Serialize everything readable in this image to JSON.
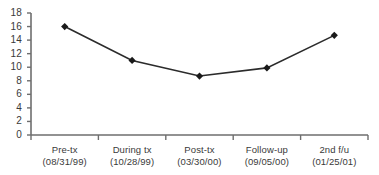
{
  "chart_data": {
    "type": "line",
    "title": "",
    "subtitle": "",
    "xlabel": "",
    "ylabel": "",
    "categories": [
      "Pre-tx",
      "During tx",
      "Post-tx",
      "Follow-up",
      "2nd f/u"
    ],
    "category_dates": [
      "(08/31/99)",
      "(10/28/99)",
      "(03/30/00)",
      "(09/05/00)",
      "(01/25/01)"
    ],
    "series": [
      {
        "name": "",
        "values": [
          16.0,
          11.0,
          8.7,
          9.9,
          14.7
        ]
      }
    ],
    "ylim": [
      0,
      18
    ],
    "yticks": [
      0,
      2,
      4,
      6,
      8,
      10,
      12,
      14,
      16,
      18
    ],
    "ytick_labels": [
      "0",
      "2",
      "4",
      "6",
      "8",
      "10",
      "12",
      "14",
      "16",
      "18"
    ],
    "grid": false,
    "legend": "none",
    "marker": "diamond",
    "line_color": "#2b2b2b",
    "marker_color": "#1a1a1a",
    "axis_color": "#6e6e6e",
    "text_color": "#3a3a3a"
  }
}
